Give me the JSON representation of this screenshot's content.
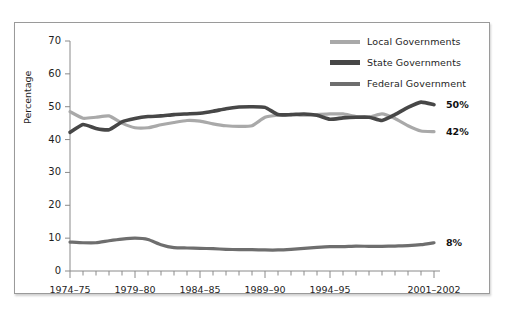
{
  "chart_data": {
    "type": "line",
    "title": "",
    "subtitle": "",
    "xlabel": "",
    "ylabel": "Percentage",
    "ylim": [
      0,
      70
    ],
    "yticks": [
      0,
      10,
      20,
      30,
      40,
      50,
      60,
      70
    ],
    "grid": false,
    "legend_position": "top-right",
    "x_tick_count": 29,
    "x_tick_labels": [
      "1974–75",
      "1979–80",
      "1984–85",
      "1989–90",
      "1994–95",
      "2001–2002"
    ],
    "x_tick_label_indices": [
      0,
      5,
      10,
      15,
      20,
      28
    ],
    "x": [
      "1974–75",
      "1975–76",
      "1976–77",
      "1977–78",
      "1978–79",
      "1979–80",
      "1980–81",
      "1981–82",
      "1982–83",
      "1983–84",
      "1984–85",
      "1985–86",
      "1986–87",
      "1987–88",
      "1988–89",
      "1989–90",
      "1990–91",
      "1991–92",
      "1992–93",
      "1993–94",
      "1994–95",
      "1995–96",
      "1996–97",
      "1997–98",
      "1998–99",
      "1999–2000",
      "2000–2001",
      "2001–2002",
      "2001–2002"
    ],
    "series": [
      {
        "name": "Local Governments",
        "color": "#a9a9a9",
        "end_value_label": "42%",
        "values": [
          48.5,
          46.5,
          46.8,
          47.2,
          45.0,
          43.6,
          43.6,
          44.5,
          45.2,
          45.8,
          45.6,
          44.8,
          44.2,
          44.0,
          44.2,
          46.8,
          47.4,
          47.6,
          47.4,
          47.6,
          47.8,
          47.8,
          47.0,
          46.8,
          47.8,
          46.4,
          44.2,
          42.6,
          42.4
        ]
      },
      {
        "name": "State Governments",
        "color": "#474747",
        "end_value_label": "50%",
        "values": [
          42.2,
          44.6,
          43.4,
          43.0,
          45.4,
          46.4,
          47.0,
          47.2,
          47.6,
          47.8,
          48.0,
          48.6,
          49.4,
          49.9,
          50.0,
          49.8,
          47.6,
          47.6,
          47.8,
          47.4,
          46.2,
          46.6,
          46.8,
          46.8,
          45.8,
          47.6,
          49.8,
          51.4,
          50.6
        ]
      },
      {
        "name": "Federal Government",
        "color": "#6e6e6e",
        "end_value_label": "8%",
        "values": [
          8.8,
          8.6,
          8.6,
          9.2,
          9.7,
          10.0,
          9.6,
          8.0,
          7.1,
          7.0,
          6.9,
          6.8,
          6.6,
          6.5,
          6.5,
          6.4,
          6.4,
          6.6,
          6.9,
          7.2,
          7.4,
          7.4,
          7.6,
          7.5,
          7.5,
          7.6,
          7.7,
          8.0,
          8.6
        ]
      }
    ]
  },
  "legend": {
    "items": [
      {
        "label": "Local Governments"
      },
      {
        "label": "State Governments"
      },
      {
        "label": "Federal Government"
      }
    ]
  },
  "annotations": {
    "state_end": "50%",
    "local_end": "42%",
    "federal_end": "8%"
  },
  "axis": {
    "ylabel": "Percentage"
  }
}
